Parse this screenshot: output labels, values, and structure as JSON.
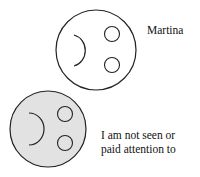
{
  "figures": [
    {
      "label": "Martina",
      "fill": "#ffffff",
      "stroke": "#222222"
    },
    {
      "label_line1": "I am not seen or",
      "label_line2": "paid attention to",
      "fill": "#e2e2e2",
      "stroke": "#222222"
    }
  ]
}
